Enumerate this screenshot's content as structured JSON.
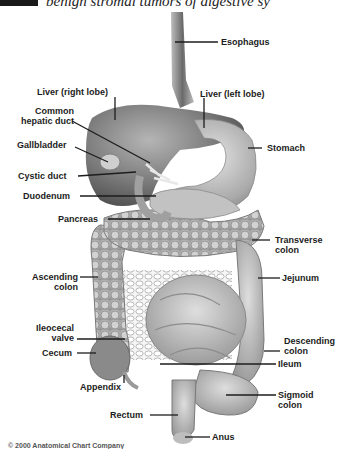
{
  "header": {
    "text": "benign stromal tumors of digestive sy"
  },
  "diagram": {
    "labels": {
      "esophagus": "Esophagus",
      "liver_right": "Liver (right lobe)",
      "liver_left": "Liver (left lobe)",
      "common_hepatic_1": "Common",
      "common_hepatic_2": "hepatic duct",
      "gallbladder": "Gallbladder",
      "stomach": "Stomach",
      "cystic_duct": "Cystic duct",
      "duodenum": "Duodenum",
      "pancreas": "Pancreas",
      "transverse_1": "Transverse",
      "transverse_2": "colon",
      "ascending_1": "Ascending",
      "ascending_2": "colon",
      "jejunum": "Jejunum",
      "ileocecal_1": "Ileocecal",
      "ileocecal_2": "valve",
      "cecum": "Cecum",
      "descending_1": "Descending",
      "descending_2": "colon",
      "ileum": "Ileum",
      "appendix": "Appendix",
      "sigmoid_1": "Sigmoid",
      "sigmoid_2": "colon",
      "rectum": "Rectum",
      "anus": "Anus"
    },
    "colors": {
      "organ_dark": "#6e6e6e",
      "organ_mid": "#a8a8a8",
      "organ_light": "#d6d6d6",
      "leader": "#1c1c1c"
    }
  },
  "footer": {
    "copyright": "© 2000 Anatomical Chart Company"
  }
}
